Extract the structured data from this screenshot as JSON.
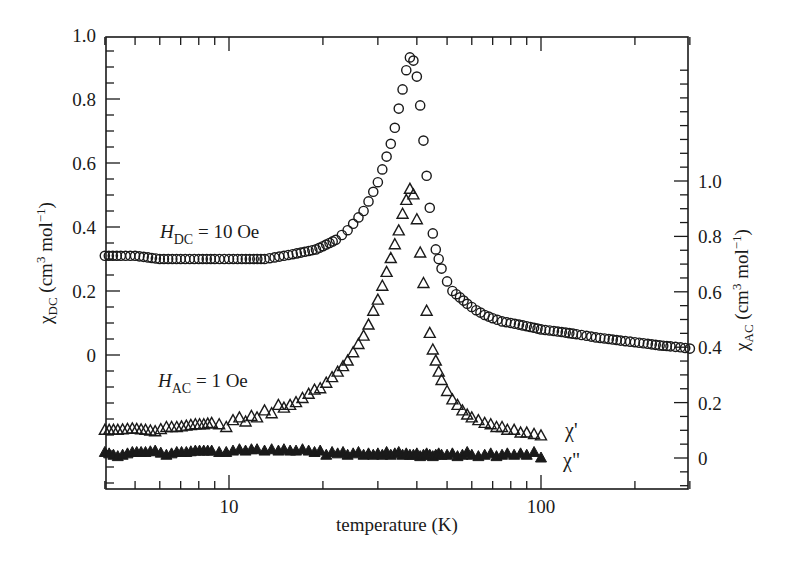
{
  "chart_data": {
    "type": "scatter",
    "title": "",
    "xlabel": "temperature (K)",
    "xscale": "log",
    "xlim": [
      4,
      300
    ],
    "x_ticks": [
      {
        "value": 10,
        "label": "10"
      },
      {
        "value": 100,
        "label": "100"
      }
    ],
    "ylabel_left": {
      "symbol": "χ",
      "sub": "DC",
      "unit_prefix": " (cm",
      "sup": "3",
      "unit_suffix": " mol",
      "sup2": "−1",
      "close": ")"
    },
    "ylabel_right": {
      "symbol": "χ",
      "sub": "AC",
      "unit_prefix": " (cm",
      "sup": "3",
      "unit_suffix": " mol",
      "sup2": "−1",
      "close": ")"
    },
    "ylim_left": [
      -0.42,
      1.0
    ],
    "ylim_right": [
      -0.11,
      1.0
    ],
    "y_ticks_left": [
      {
        "value": 1.0,
        "label": "1.0"
      },
      {
        "value": 0.8,
        "label": "0.8"
      },
      {
        "value": 0.6,
        "label": "0.6"
      },
      {
        "value": 0.4,
        "label": "0.4"
      },
      {
        "value": 0.2,
        "label": "0.2"
      },
      {
        "value": 0,
        "label": "0"
      }
    ],
    "y_ticks_right": [
      {
        "value": 1.0,
        "label": "1.0"
      },
      {
        "value": 0.8,
        "label": "0.8"
      },
      {
        "value": 0.6,
        "label": "0.6"
      },
      {
        "value": 0.4,
        "label": "0.4"
      },
      {
        "value": 0.2,
        "label": "0.2"
      },
      {
        "value": 0,
        "label": "0"
      }
    ],
    "grid": false,
    "annotations": [
      {
        "id": "hdc",
        "italic": "H",
        "sub": "DC",
        "text": " = 10 Oe",
        "x": 160,
        "y": 238
      },
      {
        "id": "hac",
        "italic": "H",
        "sub": "AC",
        "text": " = 1 Oe",
        "x": 158,
        "y": 387
      },
      {
        "id": "chi1",
        "text": "χ'",
        "x": 565,
        "y": 437
      },
      {
        "id": "chi2",
        "text": "χ\"",
        "x": 563,
        "y": 467
      }
    ],
    "series": [
      {
        "name": "χ_DC (H_DC = 10 Oe)",
        "axis": "left",
        "marker": "open-circle",
        "x": [
          4,
          4.5,
          5,
          5.5,
          6,
          7,
          8,
          9,
          10,
          11,
          12,
          13,
          14,
          15,
          16,
          17,
          18,
          19,
          20,
          21,
          22,
          23,
          24,
          25,
          26,
          27,
          28,
          29,
          30,
          31,
          32,
          33,
          34,
          35,
          36,
          37,
          38,
          39,
          40,
          41,
          42,
          43,
          44,
          45,
          46,
          47,
          48,
          50,
          52,
          55,
          58,
          62,
          66,
          70,
          75,
          80,
          85,
          90,
          95,
          100,
          110,
          120,
          130,
          140,
          150,
          165,
          180,
          200,
          220,
          240,
          260,
          280,
          300
        ],
        "values": [
          0.31,
          0.31,
          0.31,
          0.305,
          0.3,
          0.3,
          0.3,
          0.3,
          0.3,
          0.3,
          0.3,
          0.3,
          0.305,
          0.31,
          0.315,
          0.32,
          0.325,
          0.33,
          0.34,
          0.35,
          0.36,
          0.375,
          0.39,
          0.41,
          0.43,
          0.45,
          0.48,
          0.51,
          0.54,
          0.58,
          0.62,
          0.66,
          0.71,
          0.77,
          0.83,
          0.89,
          0.93,
          0.92,
          0.87,
          0.78,
          0.67,
          0.56,
          0.46,
          0.38,
          0.33,
          0.3,
          0.27,
          0.23,
          0.2,
          0.18,
          0.16,
          0.14,
          0.125,
          0.115,
          0.105,
          0.1,
          0.095,
          0.09,
          0.085,
          0.08,
          0.075,
          0.07,
          0.065,
          0.06,
          0.055,
          0.05,
          0.045,
          0.04,
          0.035,
          0.03,
          0.027,
          0.024,
          0.02
        ]
      },
      {
        "name": "χ' (H_AC = 1 Oe)",
        "axis": "right",
        "marker": "open-triangle",
        "x": [
          4,
          4.4,
          4.9,
          5.4,
          5.8,
          6.3,
          6.8,
          7.3,
          7.8,
          8.3,
          8.8,
          9.3,
          9.8,
          10.3,
          10.8,
          11.3,
          11.8,
          12.3,
          13,
          13.7,
          14.4,
          15,
          15.7,
          16.4,
          17.2,
          18,
          18.8,
          19.6,
          20.5,
          21.4,
          22.3,
          23.2,
          24,
          25,
          26,
          27,
          28,
          29,
          30,
          31,
          32,
          33,
          34,
          35,
          36,
          37,
          38,
          39,
          40,
          41,
          42,
          43,
          44,
          45,
          46,
          47,
          48,
          50,
          52,
          54,
          56,
          58,
          60,
          63,
          66,
          69,
          72,
          75,
          78,
          82,
          86,
          90,
          95,
          100
        ],
        "values": [
          0.1,
          0.1,
          0.105,
          0.1,
          0.095,
          0.11,
          0.11,
          0.115,
          0.12,
          0.12,
          0.125,
          0.12,
          0.11,
          0.135,
          0.145,
          0.13,
          0.15,
          0.145,
          0.17,
          0.16,
          0.19,
          0.18,
          0.19,
          0.2,
          0.215,
          0.23,
          0.245,
          0.25,
          0.27,
          0.29,
          0.31,
          0.33,
          0.35,
          0.38,
          0.41,
          0.44,
          0.48,
          0.53,
          0.57,
          0.62,
          0.67,
          0.72,
          0.77,
          0.82,
          0.88,
          0.93,
          0.97,
          0.95,
          0.86,
          0.74,
          0.63,
          0.53,
          0.45,
          0.39,
          0.35,
          0.31,
          0.28,
          0.24,
          0.21,
          0.19,
          0.17,
          0.155,
          0.145,
          0.135,
          0.125,
          0.12,
          0.11,
          0.11,
          0.1,
          0.1,
          0.09,
          0.09,
          0.085,
          0.08
        ]
      },
      {
        "name": "χ'' (H_AC = 1 Oe)",
        "axis": "right",
        "marker": "filled-triangle",
        "x": [
          4,
          4.4,
          4.9,
          5.4,
          5.8,
          6.3,
          6.8,
          7.3,
          7.8,
          8.3,
          8.8,
          9.3,
          9.8,
          10.3,
          10.8,
          11.3,
          11.8,
          12.3,
          13,
          13.7,
          14.4,
          15,
          15.7,
          16.4,
          17.2,
          18,
          18.8,
          19.6,
          20.5,
          21.4,
          22.3,
          23.2,
          24,
          25,
          26,
          27,
          28,
          29,
          30,
          31,
          32,
          33,
          34,
          35,
          36,
          37,
          38,
          39,
          40,
          41,
          42,
          43,
          44,
          45,
          46,
          47,
          48,
          50,
          52,
          54,
          56,
          58,
          60,
          63,
          66,
          69,
          72,
          75,
          78,
          82,
          86,
          90,
          95,
          100
        ],
        "values": [
          0.02,
          0.005,
          0.02,
          0.02,
          0.025,
          0.01,
          0.02,
          0.02,
          0.025,
          0.025,
          0.025,
          0.02,
          0.02,
          0.025,
          0.03,
          0.025,
          0.03,
          0.03,
          0.025,
          0.03,
          0.025,
          0.03,
          0.025,
          0.025,
          0.03,
          0.025,
          0.02,
          0.025,
          0.01,
          0.02,
          0.015,
          0.02,
          0.01,
          0.015,
          0.02,
          0.01,
          0.015,
          0.01,
          0.015,
          0.01,
          0.02,
          0.01,
          0.015,
          0.02,
          0.01,
          0.015,
          0.01,
          0.01,
          0.015,
          0.005,
          0.01,
          0.015,
          0.01,
          0.005,
          0.01,
          0.015,
          0.01,
          0.01,
          0.015,
          0.005,
          0.01,
          0.02,
          0.01,
          0.005,
          0.01,
          0.015,
          0.005,
          0.01,
          0.015,
          0.01,
          0.015,
          0.01,
          0.02,
          0.0
        ]
      }
    ]
  }
}
